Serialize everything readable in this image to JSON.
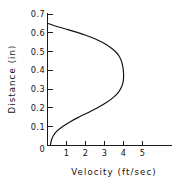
{
  "chart_data": {
    "type": "line",
    "title": "",
    "xlabel": "Velocity (ft/sec)",
    "ylabel": "Distance (in)",
    "xlim": [
      0,
      5.9
    ],
    "ylim": [
      0,
      0.7
    ],
    "grid": false,
    "legend": null,
    "x_ticks": [
      0,
      1,
      2,
      3,
      4,
      5
    ],
    "x_tick_labels": [
      "0",
      "1",
      "2",
      "3",
      "4",
      "5"
    ],
    "y_ticks": [
      0,
      0.1,
      0.2,
      0.3,
      0.4,
      0.5,
      0.6,
      0.7
    ],
    "y_tick_labels": [
      "0",
      "0.1",
      "0.2",
      "0.3",
      "0.4",
      "0.5",
      "0.6",
      "0.7"
    ],
    "series": [
      {
        "name": "velocity-profile",
        "color": "#111111",
        "x": [
          0.0,
          0.4,
          0.95,
          1.52,
          2.05,
          2.52,
          2.93,
          3.28,
          3.57,
          3.79,
          3.93,
          4.0,
          3.99,
          3.9,
          3.73,
          3.47,
          3.12,
          2.7,
          2.23,
          1.73,
          1.22,
          0.76,
          0.42,
          0.23,
          0.15
        ],
        "y": [
          0.65,
          0.636,
          0.62,
          0.603,
          0.585,
          0.566,
          0.546,
          0.524,
          0.5,
          0.472,
          0.436,
          0.39,
          0.345,
          0.312,
          0.283,
          0.256,
          0.23,
          0.205,
          0.18,
          0.155,
          0.128,
          0.098,
          0.068,
          0.036,
          0.0
        ]
      }
    ],
    "annotations": {
      "peak_velocity": 4.0,
      "peak_velocity_distance": 0.32,
      "surface_distance": 0.65
    }
  },
  "axes": {
    "y_title": "Distance (in)",
    "x_title": "Velocity (ft/sec)"
  },
  "colors": {
    "curve": "#111111",
    "axis": "#1a1a1a",
    "background": "#ffffff",
    "text": "#111111"
  }
}
